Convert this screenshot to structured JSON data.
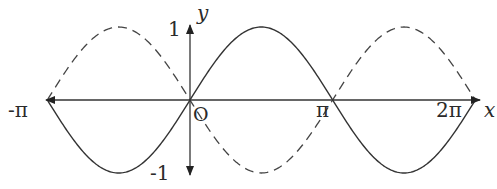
{
  "diagram": {
    "axes": {
      "x_label": "x",
      "y_label": "y",
      "origin_label": "O",
      "x_ticks": [
        "-π",
        "π",
        "2π"
      ],
      "y_ticks": [
        "1",
        "-1"
      ]
    },
    "curves": [
      {
        "name": "sin x",
        "style": "solid",
        "domain": [
          "-π",
          "2π"
        ]
      },
      {
        "name": "-sin x",
        "style": "dashed",
        "domain": [
          "-π",
          "2π"
        ]
      }
    ],
    "colors": {
      "line": "#333333",
      "background": "#ffffff"
    }
  }
}
